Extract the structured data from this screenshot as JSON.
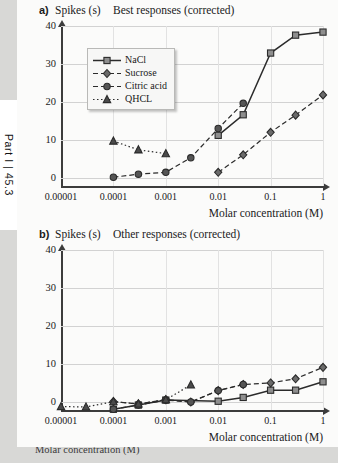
{
  "running_head": "Part I | 45.3",
  "panels": [
    {
      "key": "a",
      "label": "a)",
      "ylabel": "Spikes (s)",
      "title": "Best responses (corrected)"
    },
    {
      "key": "b",
      "label": "b)",
      "ylabel": "Spikes (s)",
      "title": "Other responses (corrected)"
    }
  ],
  "axes": {
    "xlabel": "Molar concentration (M)",
    "xticks": [
      "0.00001",
      "0.0001",
      "0.001",
      "0.01",
      "0.1",
      "1"
    ],
    "xtick_values": [
      1e-05,
      0.0001,
      0.001,
      0.01,
      0.1,
      1
    ],
    "yticks": [
      "0",
      "10",
      "20",
      "30",
      "40"
    ],
    "ytick_values": [
      0,
      10,
      20,
      30,
      40
    ]
  },
  "legend": {
    "position": "upper-left",
    "entries": [
      {
        "label": "NaCl",
        "marker": "square",
        "line": "solid",
        "color": "#2b2b2b"
      },
      {
        "label": "Sucrose",
        "marker": "diamond",
        "line": "dashed",
        "color": "#2b2b2b"
      },
      {
        "label": "Citric acid",
        "marker": "circle",
        "line": "dashed",
        "color": "#2b2b2b"
      },
      {
        "label": "QHCL",
        "marker": "triangle",
        "line": "dotted",
        "color": "#2b2b2b"
      }
    ]
  },
  "caption_partial": "Molar concentration (M)",
  "chart_data": [
    {
      "type": "line",
      "panel": "a",
      "title": "Best responses (corrected)",
      "xlabel": "Molar concentration (M)",
      "ylabel": "Spikes (s)",
      "xscale": "log",
      "xlim": [
        1e-05,
        1
      ],
      "ylim": [
        -2,
        40
      ],
      "grid": true,
      "series": [
        {
          "name": "NaCl",
          "marker": "square",
          "line": "solid",
          "points": [
            {
              "x": 0.01,
              "y": 11.3
            },
            {
              "x": 0.03,
              "y": 16.7
            },
            {
              "x": 0.1,
              "y": 32.9
            },
            {
              "x": 0.3,
              "y": 37.6
            },
            {
              "x": 1.0,
              "y": 38.4
            }
          ]
        },
        {
          "name": "Sucrose",
          "marker": "diamond",
          "line": "dashed",
          "points": [
            {
              "x": 0.01,
              "y": 1.6
            },
            {
              "x": 0.03,
              "y": 6.2
            },
            {
              "x": 0.1,
              "y": 12.1
            },
            {
              "x": 0.3,
              "y": 16.6
            },
            {
              "x": 1.0,
              "y": 21.9
            }
          ]
        },
        {
          "name": "Citric acid",
          "marker": "circle",
          "line": "dashed",
          "points": [
            {
              "x": 0.0001,
              "y": 0.3
            },
            {
              "x": 0.0003,
              "y": 1.1
            },
            {
              "x": 0.001,
              "y": 1.6
            },
            {
              "x": 0.003,
              "y": 5.4
            },
            {
              "x": 0.01,
              "y": 13.1
            },
            {
              "x": 0.03,
              "y": 19.7
            }
          ]
        },
        {
          "name": "QHCL",
          "marker": "triangle",
          "line": "dotted",
          "points": [
            {
              "x": 0.0001,
              "y": 9.8
            },
            {
              "x": 0.0003,
              "y": 7.5
            },
            {
              "x": 0.001,
              "y": 6.5
            }
          ]
        }
      ]
    },
    {
      "type": "line",
      "panel": "b",
      "title": "Other responses (corrected)",
      "xlabel": "Molar concentration (M)",
      "ylabel": "Spikes (s)",
      "xscale": "log",
      "xlim": [
        1e-05,
        1
      ],
      "ylim": [
        -2,
        40
      ],
      "grid": true,
      "series": [
        {
          "name": "NaCl",
          "marker": "square",
          "line": "solid",
          "points": [
            {
              "x": 0.0001,
              "y": -1.8
            },
            {
              "x": 0.0003,
              "y": -0.7
            },
            {
              "x": 0.001,
              "y": 0.6
            },
            {
              "x": 0.01,
              "y": 0.3
            },
            {
              "x": 0.03,
              "y": 1.3
            },
            {
              "x": 0.1,
              "y": 3.2
            },
            {
              "x": 0.3,
              "y": 3.2
            },
            {
              "x": 1.0,
              "y": 5.4
            }
          ]
        },
        {
          "name": "Sucrose",
          "marker": "diamond",
          "line": "dashed",
          "points": [
            {
              "x": 0.0001,
              "y": 0.2
            },
            {
              "x": 0.0003,
              "y": -0.4
            },
            {
              "x": 0.001,
              "y": 0.7
            },
            {
              "x": 0.003,
              "y": 0.1
            },
            {
              "x": 0.01,
              "y": 3.1
            },
            {
              "x": 0.03,
              "y": 4.7
            },
            {
              "x": 0.1,
              "y": 5.1
            },
            {
              "x": 0.3,
              "y": 6.2
            },
            {
              "x": 1.0,
              "y": 9.2
            }
          ]
        },
        {
          "name": "Citric acid",
          "marker": "circle",
          "line": "dashed",
          "points": [
            {
              "x": 0.0001,
              "y": -1.8
            },
            {
              "x": 0.0003,
              "y": -0.7
            },
            {
              "x": 0.001,
              "y": 0.6
            },
            {
              "x": 0.003,
              "y": 0.1
            },
            {
              "x": 0.01,
              "y": 3.1
            },
            {
              "x": 0.03,
              "y": 4.7
            }
          ]
        },
        {
          "name": "QHCL",
          "marker": "triangle",
          "line": "dotted",
          "points": [
            {
              "x": 1e-05,
              "y": -1.1
            },
            {
              "x": 3e-05,
              "y": -1.2
            },
            {
              "x": 0.0001,
              "y": 0.2
            },
            {
              "x": 0.0003,
              "y": -0.4
            },
            {
              "x": 0.001,
              "y": 0.7
            },
            {
              "x": 0.003,
              "y": 4.6
            }
          ]
        }
      ]
    }
  ]
}
